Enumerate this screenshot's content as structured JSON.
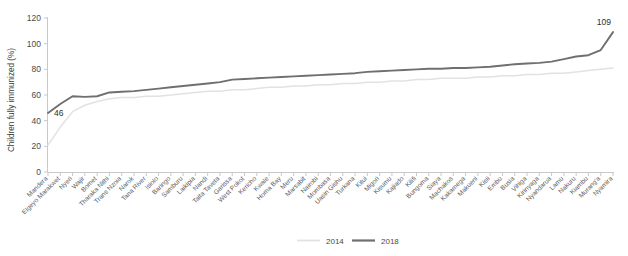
{
  "chart_data": {
    "type": "line",
    "title": "",
    "xlabel": "",
    "ylabel": "Children fully immunized (%)",
    "ylim": [
      0,
      120
    ],
    "yticks": [
      0,
      20,
      40,
      60,
      80,
      100,
      120
    ],
    "grid": false,
    "legend_position": "bottom-center",
    "categories": [
      "Mandera",
      "Elgeyo Marakwet",
      "Nyeri",
      "Wajir",
      "Bomet",
      "Tharaka Nithi",
      "Trans Nzoia",
      "Narok",
      "Tana River",
      "Isiolo",
      "Baringo",
      "Samburu",
      "Laikipia",
      "Nandi",
      "Taita Taveta",
      "Garissa",
      "West Pokot",
      "Kericho",
      "Kwale",
      "Homa Bay",
      "Meru",
      "Marsabit",
      "Nairobi",
      "Mombasa",
      "Uasin Gishu",
      "Turkana",
      "Kitui",
      "Migori",
      "Kisumu",
      "Kajiado",
      "Kilifi",
      "Bungoma",
      "Siaya",
      "Machakos",
      "Kakamega",
      "Makueni",
      "Kisii",
      "Embu",
      "Busia",
      "Vihiga",
      "Kirinyaga",
      "Nyandarua",
      "Lamu",
      "Nakuru",
      "Kiambu",
      "Murang'a",
      "Nyamira"
    ],
    "series": [
      {
        "name": "2014",
        "color": "#e2e2e2",
        "values": [
          21,
          35,
          47,
          52,
          55,
          57,
          58,
          58,
          59,
          59,
          60,
          61,
          62,
          63,
          63,
          64,
          64,
          65,
          66,
          66,
          67,
          67,
          68,
          68,
          69,
          69,
          70,
          70,
          71,
          71,
          72,
          72,
          73,
          73,
          73,
          74,
          74,
          75,
          75,
          76,
          76,
          77,
          77,
          78,
          79,
          80,
          81
        ]
      },
      {
        "name": "2018",
        "color": "#6f6f6f",
        "values": [
          46,
          53,
          59,
          58.5,
          59,
          62,
          62.5,
          63,
          64,
          65,
          66,
          67,
          68,
          69,
          70,
          72,
          72.5,
          73,
          73.5,
          74,
          74.5,
          75,
          75.5,
          76,
          76.5,
          77,
          78,
          78.5,
          79,
          79.5,
          80,
          80.5,
          80.5,
          81,
          81,
          81.5,
          82,
          83,
          84,
          84.5,
          85,
          86,
          88,
          90,
          91,
          95,
          109
        ]
      }
    ],
    "annotations": [
      {
        "label": "46",
        "series": "2018",
        "index": 0,
        "value": 46
      },
      {
        "label": "109",
        "series": "2018",
        "index": 46,
        "value": 109
      }
    ],
    "legend": [
      {
        "label": "2014",
        "color": "#e2e2e2"
      },
      {
        "label": "2018",
        "color": "#6f6f6f"
      }
    ]
  },
  "colors": {
    "series_2014": "#e2e2e2",
    "series_2018": "#6f6f6f",
    "axis": "#c9c9c9",
    "text": "#4a4a4a",
    "background": "#ffffff"
  }
}
